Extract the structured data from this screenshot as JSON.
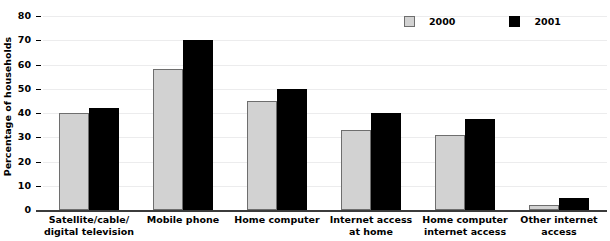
{
  "chart_data": {
    "type": "bar",
    "title": "",
    "xlabel": "",
    "ylabel": "Percentage of households",
    "ylim": [
      0,
      80
    ],
    "yticks": [
      0,
      10,
      20,
      30,
      40,
      50,
      60,
      70,
      80
    ],
    "ytick_labels": [
      "0",
      "10",
      "20",
      "30",
      "40",
      "50",
      "60",
      "70",
      "80"
    ],
    "grid": true,
    "legend_position": "top-right",
    "categories": [
      "Satellite/cable/\ndigital television",
      "Mobile phone",
      "Home computer",
      "Internet access\nat home",
      "Home computer\ninternet access",
      "Other internet\naccess"
    ],
    "series": [
      {
        "name": "2000",
        "color": "#d2d2d2",
        "values": [
          40,
          58,
          45,
          33,
          31,
          2
        ]
      },
      {
        "name": "2001",
        "color": "#000000",
        "values": [
          42,
          70,
          50,
          40,
          37.5,
          5
        ]
      }
    ]
  },
  "legend": {
    "items": [
      {
        "label": "2000"
      },
      {
        "label": "2001"
      }
    ]
  }
}
